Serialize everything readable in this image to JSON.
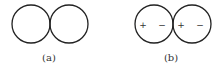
{
  "figures": [
    {
      "id": "a",
      "label": "(a)",
      "circles": [
        {
          "cx": 31,
          "cy": 24,
          "r": 19
        },
        {
          "cx": 69,
          "cy": 24,
          "r": 19
        }
      ],
      "charges": []
    },
    {
      "id": "b",
      "label": "(b)",
      "circles": [
        {
          "cx": 154,
          "cy": 24,
          "r": 19
        },
        {
          "cx": 192,
          "cy": 24,
          "r": 19
        }
      ],
      "charges": [
        {
          "x": 143,
          "y": 24,
          "sign": "+"
        },
        {
          "x": 162,
          "y": 24,
          "sign": "−"
        },
        {
          "x": 181,
          "y": 24,
          "sign": "+"
        },
        {
          "x": 200,
          "y": 24,
          "sign": "−"
        }
      ]
    }
  ],
  "colors": {
    "stroke": "#222222",
    "text": "#333333"
  }
}
